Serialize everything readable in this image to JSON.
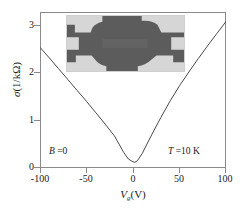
{
  "chart_data": {
    "type": "line",
    "title": "",
    "xlabel": "V_g (V)",
    "ylabel": "sigma (1/kOhm)",
    "xlim": [
      -100,
      100
    ],
    "ylim": [
      0,
      3.3
    ],
    "xticks": [
      -100,
      -50,
      0,
      50,
      100
    ],
    "yticks": [
      0,
      1,
      2,
      3
    ],
    "grid": false,
    "legend": null,
    "annotations": [
      {
        "text": "B = 0",
        "x": -80,
        "y": 0.45
      },
      {
        "text": "T = 10 K",
        "x": 55,
        "y": 0.45
      }
    ],
    "series": [
      {
        "name": "conductivity",
        "x": [
          -100,
          -90,
          -80,
          -70,
          -60,
          -50,
          -40,
          -30,
          -20,
          -10,
          -5,
          0,
          2,
          5,
          10,
          20,
          30,
          40,
          50,
          60,
          70,
          80,
          90,
          100
        ],
        "values": [
          2.55,
          2.33,
          2.1,
          1.87,
          1.64,
          1.41,
          1.17,
          0.93,
          0.68,
          0.33,
          0.19,
          0.13,
          0.12,
          0.16,
          0.31,
          0.7,
          1.07,
          1.42,
          1.74,
          2.03,
          2.31,
          2.58,
          2.84,
          3.1
        ]
      }
    ]
  },
  "axes": {
    "y_title_sigma": "σ",
    "y_title_units": "(1/kΩ)",
    "x_title_v": "V",
    "x_title_sub": "g",
    "x_title_units": "(V)",
    "ytick_labels": [
      "3",
      "2",
      "1",
      "0"
    ],
    "xtick_labels": [
      "-100",
      "-50",
      "0",
      "50",
      "100"
    ]
  },
  "annotations": {
    "magnetic_field": "B =0",
    "temperature": "T =10 K"
  },
  "inset": {
    "caption": "device-micrograph",
    "background_color": "#5c5c5c",
    "electrode_color": "#d6d6d6"
  },
  "colors": {
    "curve": "#4a4a4a",
    "frame": "#8a8a8a",
    "text": "#1a1a1a",
    "background": "#ffffff"
  }
}
